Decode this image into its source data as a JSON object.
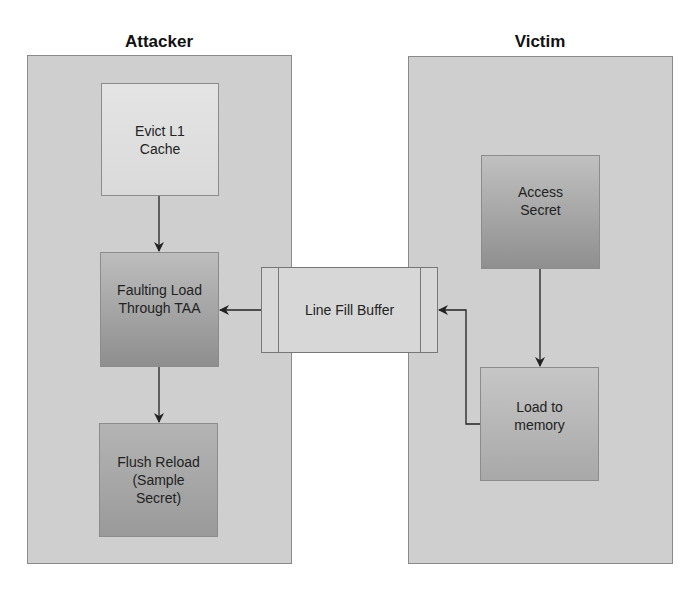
{
  "groups": {
    "attacker": {
      "title": "Attacker"
    },
    "victim": {
      "title": "Victim"
    }
  },
  "nodes": {
    "evict_l1": {
      "label": "Evict L1\nCache"
    },
    "faulting_load": {
      "label": "Faulting Load\nThrough TAA"
    },
    "flush_reload": {
      "label": "Flush Reload\n(Sample\nSecret)"
    },
    "access_secret": {
      "label": "Access\nSecret"
    },
    "load_memory": {
      "label": "Load to\nmemory"
    },
    "line_fill_buffer": {
      "label": "Line Fill Buffer"
    }
  },
  "edges": [
    {
      "from": "Evict L1 Cache",
      "to": "Faulting Load Through TAA"
    },
    {
      "from": "Faulting Load Through TAA",
      "to": "Flush Reload (Sample Secret)"
    },
    {
      "from": "Line Fill Buffer",
      "to": "Faulting Load Through TAA"
    },
    {
      "from": "Access Secret",
      "to": "Load to memory"
    },
    {
      "from": "Load to memory",
      "to": "Line Fill Buffer"
    }
  ],
  "colors": {
    "group_fill": "#cfcfcf",
    "border": "#8a8a8a",
    "arrow": "#222222"
  }
}
